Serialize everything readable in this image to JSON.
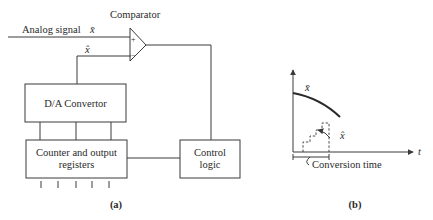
{
  "diagram_a": {
    "comparator_label": "Comparator",
    "analog_signal_label": "Analog signal",
    "input_symbol": "x̄",
    "feedback_symbol": "x̂",
    "plus_sign": "+",
    "minus_sign": "−",
    "da_convertor_label": "D/A Convertor",
    "counter_label_line1": "Counter and output",
    "counter_label_line2": "registers",
    "control_label_line1": "Control",
    "control_label_line2": "logic",
    "output_bit_count": 5,
    "caption": "(a)"
  },
  "diagram_b": {
    "signal_symbol": "x̄",
    "approx_symbol": "x̂",
    "time_axis_label": "t",
    "conversion_time_label": "Conversion time",
    "caption": "(b)"
  },
  "colors": {
    "line": "#3a3a3a",
    "text": "#2a2a2a",
    "background": "#ffffff"
  }
}
